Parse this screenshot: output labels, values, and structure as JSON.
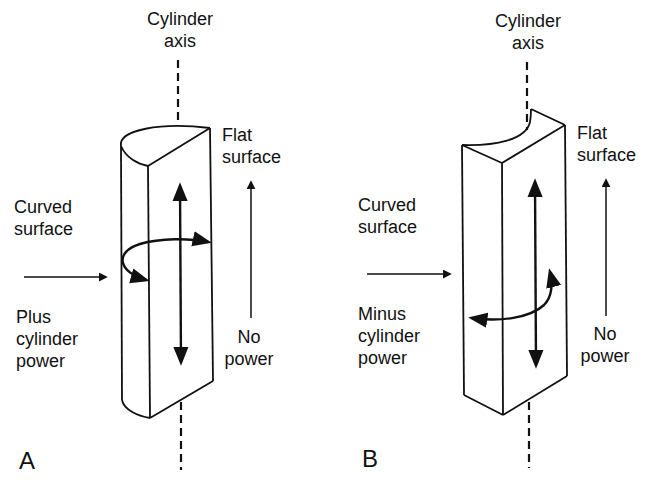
{
  "figure": {
    "panels": [
      {
        "id": "A",
        "letter": "A",
        "axis_label": {
          "line1": "Cylinder",
          "line2": "axis"
        },
        "flat_label": {
          "line1": "Flat",
          "line2": "surface"
        },
        "curved_label": {
          "line1": "Curved",
          "line2": "surface"
        },
        "power_label": {
          "line1": "Plus",
          "line2": "cylinder",
          "line3": "power"
        },
        "no_power_label": {
          "line1": "No",
          "line2": "power"
        }
      },
      {
        "id": "B",
        "letter": "B",
        "axis_label": {
          "line1": "Cylinder",
          "line2": "axis"
        },
        "flat_label": {
          "line1": "Flat",
          "line2": "surface"
        },
        "curved_label": {
          "line1": "Curved",
          "line2": "surface"
        },
        "power_label": {
          "line1": "Minus",
          "line2": "cylinder",
          "line3": "power"
        },
        "no_power_label": {
          "line1": "No",
          "line2": "power"
        }
      }
    ],
    "colors": {
      "ink": "#111111",
      "background": "#ffffff"
    }
  }
}
